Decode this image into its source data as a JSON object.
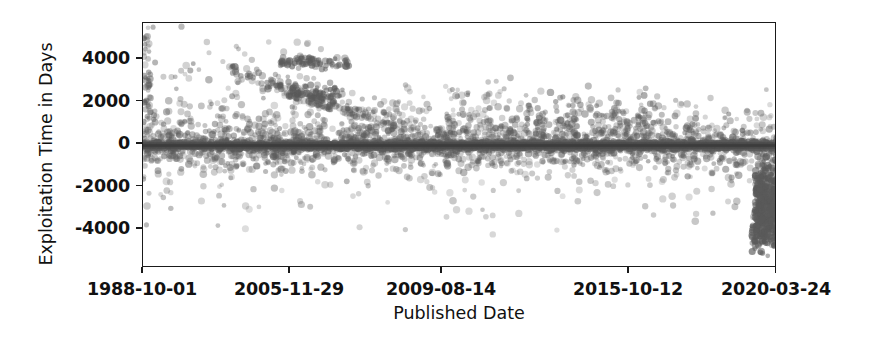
{
  "chart_data": {
    "type": "scatter",
    "title": "",
    "xlabel": "Published Date",
    "ylabel": "Exploitation Time in Days",
    "grid": false,
    "legend": null,
    "marker": {
      "shape": "circle",
      "color": "#5a5a5a",
      "opacity": 0.45,
      "size_px": 6
    },
    "background_color": "#ffffff",
    "axis_color": "#1a1a1a",
    "xlim_labels": [
      "1988-10-01",
      "2020-03-24"
    ],
    "ylim": [
      -5450,
      5450
    ],
    "xticks": [
      {
        "label": "1988-10-01",
        "pos": 0.0
      },
      {
        "label": "2005-11-29",
        "pos": 0.2318
      },
      {
        "label": "2009-08-14",
        "pos": 0.4716
      },
      {
        "label": "2015-10-12",
        "pos": 0.7666
      },
      {
        "label": "2020-03-24",
        "pos": 1.0
      }
    ],
    "yticks": [
      {
        "label": "4000",
        "value": 4000
      },
      {
        "label": "2000",
        "value": 2000
      },
      {
        "label": "0",
        "value": 0
      },
      {
        "label": "-2000",
        "value": -2000
      },
      {
        "label": "-4000",
        "value": -4000
      }
    ],
    "clusters": [
      {
        "name": "zero-band",
        "x_from": 0.0,
        "x_to": 1.0,
        "y_center": 0,
        "y_spread": 90,
        "count": 2600,
        "opacity": 0.5
      },
      {
        "name": "zero-band-dense-mid",
        "x_from": 0.22,
        "x_to": 0.98,
        "y_center": 0,
        "y_spread": 55,
        "count": 1500,
        "opacity": 0.55
      },
      {
        "name": "low-positive-halo",
        "x_from": 0.0,
        "x_to": 1.0,
        "y_center": 320,
        "y_spread": 430,
        "count": 760,
        "opacity": 0.4
      },
      {
        "name": "low-negative-halo",
        "x_from": 0.0,
        "x_to": 1.0,
        "y_center": -330,
        "y_spread": 430,
        "count": 640,
        "opacity": 0.4
      },
      {
        "name": "mid-positive-scatter",
        "x_from": 0.0,
        "x_to": 1.0,
        "y_center": 900,
        "y_spread": 700,
        "count": 300,
        "opacity": 0.35
      },
      {
        "name": "mid-negative-scatter",
        "x_from": 0.02,
        "x_to": 1.0,
        "y_center": -1100,
        "y_spread": 750,
        "count": 180,
        "opacity": 0.33
      },
      {
        "name": "left-edge-stack",
        "x_from": 0.0,
        "x_to": 0.012,
        "y_center": 1600,
        "y_spread": 2400,
        "count": 60,
        "opacity": 0.42
      },
      {
        "name": "early-high-outliers",
        "x_from": 0.0,
        "x_to": 0.3,
        "y_center": 2600,
        "y_spread": 1500,
        "count": 95,
        "opacity": 0.4
      },
      {
        "name": "band-3700",
        "x_from": 0.215,
        "x_to": 0.325,
        "y_center": 3700,
        "y_spread": 130,
        "count": 70,
        "opacity": 0.55
      },
      {
        "name": "band-2400",
        "x_from": 0.225,
        "x_to": 0.315,
        "y_center": 2380,
        "y_spread": 140,
        "count": 55,
        "opacity": 0.55
      },
      {
        "name": "declining-diagonal-a",
        "x_from": 0.14,
        "x_to": 0.33,
        "y_start": 3400,
        "y_end": 1500,
        "y_spread": 190,
        "count": 85,
        "opacity": 0.45
      },
      {
        "name": "declining-diagonal-b",
        "x_from": 0.26,
        "x_to": 0.4,
        "y_start": 2100,
        "y_end": 900,
        "y_spread": 160,
        "count": 70,
        "opacity": 0.45
      },
      {
        "name": "mid-era-positive",
        "x_from": 0.33,
        "x_to": 0.58,
        "y_center": 1100,
        "y_spread": 800,
        "count": 120,
        "opacity": 0.35
      },
      {
        "name": "late-positive-cluster",
        "x_from": 0.6,
        "x_to": 0.82,
        "y_center": 1200,
        "y_spread": 550,
        "count": 130,
        "opacity": 0.42
      },
      {
        "name": "right-edge-negative-dense",
        "x_from": 0.965,
        "x_to": 1.0,
        "y_center": -2500,
        "y_spread": 900,
        "count": 420,
        "opacity": 0.6
      },
      {
        "name": "right-edge-negative-tail",
        "x_from": 0.96,
        "x_to": 1.0,
        "y_center": -3900,
        "y_spread": 420,
        "count": 90,
        "opacity": 0.55
      },
      {
        "name": "sparse-deep-negative",
        "x_from": 0.1,
        "x_to": 0.95,
        "y_center": -2400,
        "y_spread": 900,
        "count": 45,
        "opacity": 0.3
      }
    ]
  }
}
